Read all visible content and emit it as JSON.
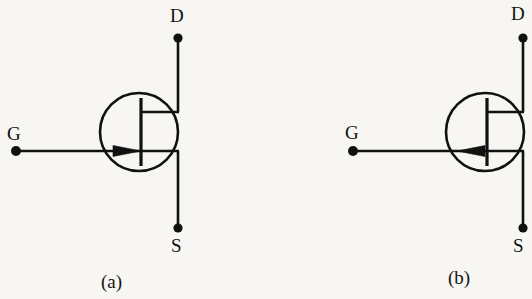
{
  "figure": {
    "background_color": "#f7f6f2",
    "stroke_color": "#111111",
    "canvas": {
      "width": 532,
      "height": 299
    }
  },
  "diagrams": [
    {
      "id": "n-channel-jfet",
      "caption": "(a)",
      "arrow_direction": "right",
      "terminals": {
        "drain_label": "D",
        "source_label": "S",
        "gate_label": "G"
      },
      "geometry": {
        "circle_cx": 139,
        "circle_cy": 132,
        "circle_r": 39,
        "channel_x": 141,
        "channel_top": 98,
        "channel_bottom": 166,
        "rail_x": 178,
        "drain_stub_y": 112,
        "source_stub_y": 151,
        "drain_dot_y": 38,
        "source_dot_y": 228,
        "gate_y": 151,
        "gate_dot_x": 16,
        "arrow_tip_x": 141,
        "arrow_tail_x": 114
      }
    },
    {
      "id": "p-channel-jfet",
      "caption": "(b)",
      "arrow_direction": "left",
      "terminals": {
        "drain_label": "D",
        "source_label": "S",
        "gate_label": "G"
      },
      "geometry": {
        "circle_cx": 485,
        "circle_cy": 132,
        "circle_r": 39,
        "channel_x": 487,
        "channel_top": 98,
        "channel_bottom": 166,
        "rail_x": 523,
        "drain_stub_y": 112,
        "source_stub_y": 151,
        "drain_dot_y": 38,
        "source_dot_y": 228,
        "gate_y": 151,
        "gate_dot_x": 353,
        "arrow_tip_x": 458,
        "arrow_tail_x": 485
      }
    }
  ],
  "labels": {
    "a_drain": "D",
    "a_source": "S",
    "a_gate": "G",
    "a_caption": "(a)",
    "b_drain": "D",
    "b_source": "S",
    "b_gate": "G",
    "b_caption": "(b)"
  }
}
